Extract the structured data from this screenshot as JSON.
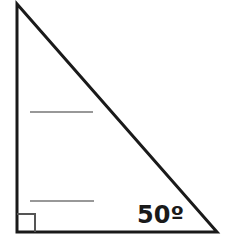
{
  "diagram": {
    "type": "right-triangle",
    "vertices": {
      "top": [
        17,
        4
      ],
      "right_angle": [
        17,
        232
      ],
      "bottom_right": [
        217,
        232
      ]
    },
    "stroke_color": "#1a1a1a",
    "right_angle_marker": {
      "x": 17,
      "y": 214,
      "size": 18,
      "color": "#555555"
    },
    "angle_label": {
      "text": "50º",
      "vertex": "bottom_right",
      "degrees": 50
    },
    "answer_blanks": [
      {
        "x1": 30,
        "x2": 93,
        "y": 112
      },
      {
        "x1": 30,
        "x2": 94,
        "y": 201
      }
    ]
  }
}
